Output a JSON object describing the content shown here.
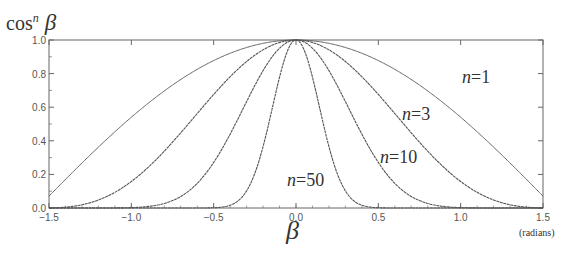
{
  "chart_data": {
    "type": "line",
    "title": "",
    "ylabel": "cosⁿ β",
    "ylabel_base": "cos",
    "ylabel_exp": "n",
    "ylabel_var": "β",
    "xlabel": "β",
    "xunit": "(radians)",
    "xlim": [
      -1.5,
      1.5
    ],
    "ylim": [
      0.0,
      1.0
    ],
    "grid": false,
    "legend": "inline labels",
    "x_ticks": [
      -1.5,
      -1.0,
      -0.5,
      0.0,
      0.5,
      1.0,
      1.5
    ],
    "x_tick_labels": [
      "−1.5",
      "−1.0",
      "−0.5",
      "0.0",
      "0.5",
      "1.0",
      "1.5"
    ],
    "y_ticks": [
      0.0,
      0.2,
      0.4,
      0.6,
      0.8,
      1.0
    ],
    "y_tick_labels": [
      "0.0",
      "0.2",
      "0.4",
      "0.6",
      "0.8",
      "1.0"
    ],
    "function": "y = cos(x)^n",
    "series": [
      {
        "name": "n = 1",
        "n": 1,
        "label_pos": [
          1.07,
          0.88
        ],
        "x": [
          -1.5,
          -1.0,
          -0.5,
          0.0,
          0.5,
          1.0,
          1.5
        ],
        "values": [
          0.071,
          0.54,
          0.878,
          1.0,
          0.878,
          0.54,
          0.071
        ]
      },
      {
        "name": "n = 3",
        "n": 3,
        "label_pos": [
          0.83,
          0.66
        ],
        "x": [
          -1.5,
          -1.0,
          -0.5,
          0.0,
          0.5,
          1.0,
          1.5
        ],
        "values": [
          0.0004,
          0.158,
          0.676,
          1.0,
          0.676,
          0.158,
          0.0004
        ]
      },
      {
        "name": "n = 10",
        "n": 10,
        "label_pos": [
          0.74,
          0.4
        ],
        "x": [
          -1.5,
          -1.0,
          -0.5,
          0.0,
          0.5,
          1.0,
          1.5
        ],
        "values": [
          0.0,
          0.002,
          0.272,
          1.0,
          0.272,
          0.002,
          0.0
        ]
      },
      {
        "name": "n = 50",
        "n": 50,
        "label_pos": [
          -0.06,
          0.17
        ],
        "x": [
          -1.5,
          -1.0,
          -0.5,
          0.0,
          0.5,
          1.0,
          1.5
        ],
        "values": [
          0.0,
          0.0,
          0.001,
          1.0,
          0.001,
          0.0,
          0.0
        ]
      }
    ]
  },
  "labels": {
    "y_axis_base": "cos",
    "y_axis_exp": "n",
    "y_axis_var": "β",
    "x_axis_var": "β",
    "x_unit": "(radians)",
    "n1_var": "n",
    "n1_val": "=1",
    "n3_var": "n",
    "n3_val": "=3",
    "n10_var": "n",
    "n10_val": "=10",
    "n50_var": "n",
    "n50_val": "=50"
  },
  "style": {
    "line_color": "#555555",
    "axis_color": "#666666",
    "background": "#ffffff"
  }
}
